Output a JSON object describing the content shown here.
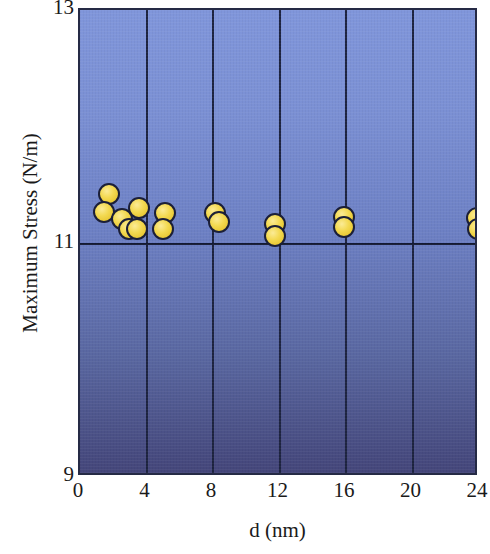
{
  "chart_data": {
    "type": "scatter",
    "title": "",
    "xlabel": "d (nm)",
    "ylabel": "Maximum Stress (N/m)",
    "xlim": [
      0,
      24
    ],
    "ylim": [
      9,
      13
    ],
    "xticks": [
      "0",
      "4",
      "8",
      "12",
      "16",
      "20",
      "24"
    ],
    "xtick_values": [
      0,
      4,
      8,
      12,
      16,
      20,
      24
    ],
    "yticks": [
      "9",
      "11",
      "13"
    ],
    "ytick_values": [
      9,
      11,
      13
    ],
    "grid": "vertical gridlines at every x tick; horizontal gridline at y = 11",
    "legend": "none",
    "marker": {
      "shape": "circle",
      "fill_color": "#f0d44a",
      "edge_color": "#1b1f38",
      "size_px": 22
    },
    "background": {
      "top_color": "#8096db",
      "bottom_color": "#44467a",
      "frame_color": "#252a45"
    },
    "n_points": 16,
    "points": [
      {
        "x": 1.75,
        "y": 11.42
      },
      {
        "x": 1.45,
        "y": 11.27
      },
      {
        "x": 2.55,
        "y": 11.21
      },
      {
        "x": 2.95,
        "y": 11.12
      },
      {
        "x": 3.55,
        "y": 11.3
      },
      {
        "x": 3.4,
        "y": 11.12
      },
      {
        "x": 5.1,
        "y": 11.26
      },
      {
        "x": 5.0,
        "y": 11.12
      },
      {
        "x": 8.15,
        "y": 11.26
      },
      {
        "x": 8.35,
        "y": 11.18
      },
      {
        "x": 11.7,
        "y": 11.17
      },
      {
        "x": 11.7,
        "y": 11.06
      },
      {
        "x": 15.85,
        "y": 11.23
      },
      {
        "x": 15.85,
        "y": 11.14
      },
      {
        "x": 23.85,
        "y": 11.22
      },
      {
        "x": 23.95,
        "y": 11.12
      }
    ]
  },
  "axes": {
    "x_title": "d (nm)",
    "y_title": "Maximum Stress (N/m)"
  }
}
